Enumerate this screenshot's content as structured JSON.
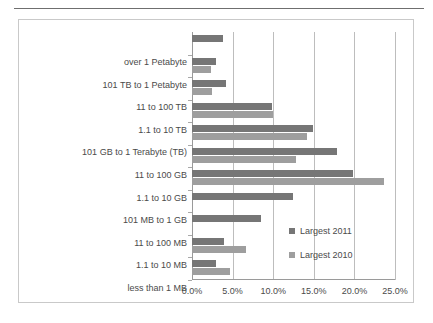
{
  "chart_data": {
    "type": "bar",
    "orientation": "horizontal",
    "title": "",
    "xlabel": "",
    "ylabel": "",
    "xlim": [
      0,
      0.25
    ],
    "xticks": [
      "0.0%",
      "5.0%",
      "10.0%",
      "15.0%",
      "20.0%",
      "25.0%"
    ],
    "xtick_values": [
      0,
      5,
      10,
      15,
      20,
      25
    ],
    "grid": true,
    "legend_position": "inside-right",
    "categories": [
      "over 1 Petabyte",
      "101 TB to 1 Petabyte",
      "11 to 100 TB",
      "1.1 to 10 TB",
      "101 GB to 1 Terabyte (TB)",
      "11 to 100 GB",
      "1.1 to 10 GB",
      "101 MB to 1 GB",
      "11 to 100 MB",
      "1.1 to 10 MB",
      "less than 1 MB"
    ],
    "series": [
      {
        "name": "Largest 2011",
        "color": "#767676",
        "values": [
          3.8,
          3.0,
          4.2,
          9.8,
          14.9,
          17.8,
          19.8,
          12.4,
          8.5,
          4.0,
          3.0
        ]
      },
      {
        "name": "Largest 2010",
        "color": "#9e9e9e",
        "values": [
          0.0,
          2.3,
          2.5,
          10.0,
          14.2,
          12.8,
          23.6,
          0.0,
          0.0,
          6.7,
          4.7
        ]
      }
    ]
  },
  "legend": {
    "items": [
      {
        "label": "Largest 2011",
        "swatch": "s2011"
      },
      {
        "label": "Largest 2010",
        "swatch": "s2010"
      }
    ]
  }
}
